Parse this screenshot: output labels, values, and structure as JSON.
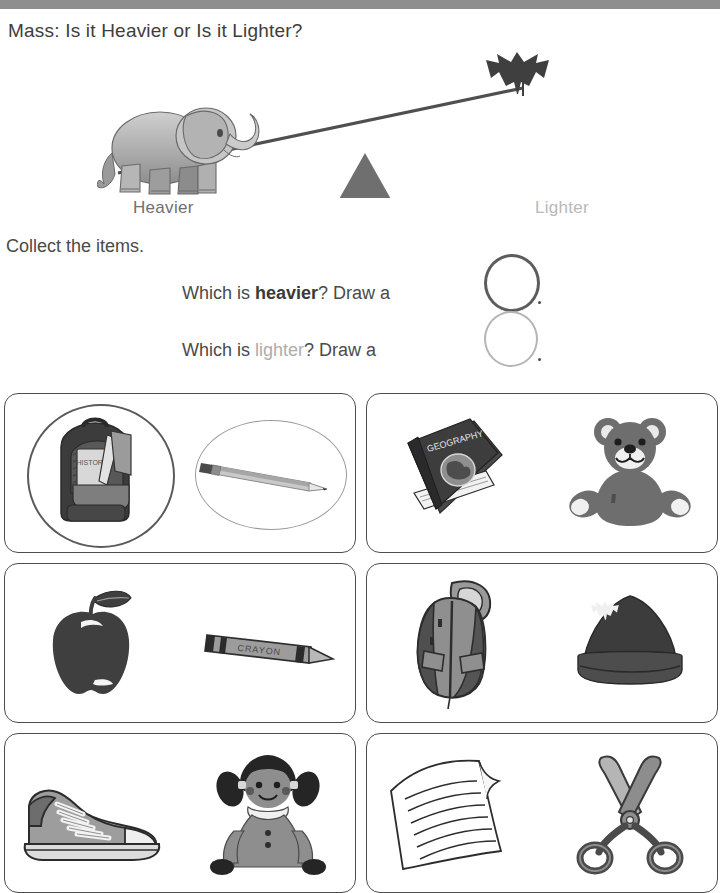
{
  "worksheet": {
    "title": "Mass: Is it Heavier or Is it Lighter?",
    "header_bar_color": "#8e8e8e"
  },
  "balance": {
    "heavy_side_object": "elephant",
    "light_side_object": "maple-leaf",
    "fulcrum": "triangle",
    "heavier_label": "Heavier",
    "lighter_label": "Lighter",
    "heavier_label_color": "#6f6f6f",
    "lighter_label_color": "#b9b9b9"
  },
  "instructions": {
    "collect": "Collect the items.",
    "heavier_prefix": "Which is ",
    "heavier_keyword": "heavier",
    "heavier_suffix": "? Draw a ",
    "heavier_period": ".",
    "lighter_prefix": "Which is ",
    "lighter_keyword": "lighter",
    "lighter_suffix": "? Draw a ",
    "lighter_period": ".",
    "heavy_circle_color": "#5d5d5d",
    "light_circle_color": "#b5b5b5"
  },
  "items": [
    {
      "box": 1,
      "left_item": "backpack",
      "left_item_detail": "HISTORY",
      "right_item": "pencil",
      "left_marked": "heavier",
      "right_marked": "lighter"
    },
    {
      "box": 2,
      "left_item": "geography-book",
      "left_item_detail": "GEOGRAPHY",
      "right_item": "teddy-bear",
      "left_marked": "",
      "right_marked": ""
    },
    {
      "box": 3,
      "left_item": "apple",
      "left_item_detail": "",
      "right_item": "crayon",
      "right_item_detail": "CRAYON",
      "left_marked": "",
      "right_marked": ""
    },
    {
      "box": 4,
      "left_item": "jacket",
      "left_item_detail": "",
      "right_item": "winter-hat",
      "left_marked": "",
      "right_marked": ""
    },
    {
      "box": 5,
      "left_item": "sneaker",
      "left_item_detail": "",
      "right_item": "doll",
      "left_marked": "",
      "right_marked": ""
    },
    {
      "box": 6,
      "left_item": "sheet-of-paper",
      "left_item_detail": "",
      "right_item": "scissors",
      "left_marked": "",
      "right_marked": ""
    }
  ]
}
